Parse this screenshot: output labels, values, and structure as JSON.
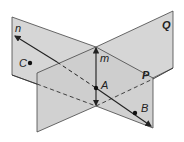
{
  "diagram": {
    "colors": {
      "plane_fill": "#d4d4d4",
      "plane_front_fill": "#cfcfcf",
      "edge": "#333333",
      "background": "#ffffff"
    },
    "planes": [
      {
        "name": "Q",
        "label": "Q"
      },
      {
        "name": "P",
        "label": "P"
      }
    ],
    "lines": [
      {
        "name": "m",
        "label": "m",
        "note": "intersection line of P and Q"
      },
      {
        "name": "n",
        "label": "n",
        "note": "line through A and B"
      }
    ],
    "points": [
      {
        "name": "A",
        "label": "A"
      },
      {
        "name": "B",
        "label": "B"
      },
      {
        "name": "C",
        "label": "C"
      }
    ]
  }
}
